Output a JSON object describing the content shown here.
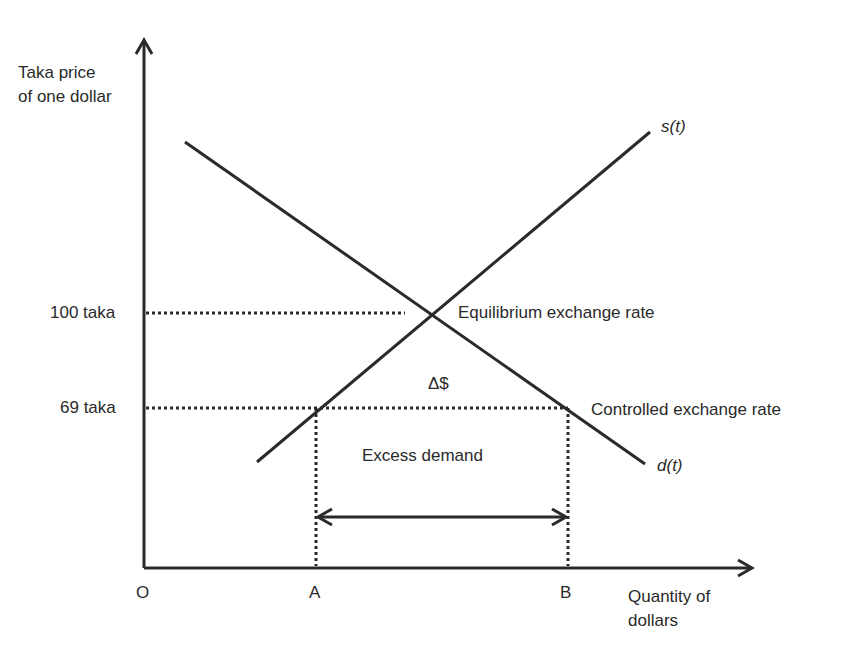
{
  "axes": {
    "y_label_line1": "Taka price",
    "y_label_line2": "of one dollar",
    "x_label_line1": "Quantity of",
    "x_label_line2": "dollars",
    "origin": "O"
  },
  "price_levels": [
    {
      "label": "100 taka",
      "name": "equilibrium"
    },
    {
      "label": "69 taka",
      "name": "controlled"
    }
  ],
  "quantity_points": {
    "a": "A",
    "b": "B"
  },
  "curves": {
    "supply": {
      "label_s": "s(",
      "label_t": "t",
      "label_close": ")"
    },
    "demand": {
      "label_d": "d(",
      "label_t": "t",
      "label_close": ")"
    }
  },
  "annotations": {
    "equilibrium": "Equilibrium exchange rate",
    "controlled": "Controlled exchange rate",
    "delta": "Δ$",
    "excess_demand": "Excess demand"
  },
  "colors": {
    "line": "#2a2a2a",
    "background": "#ffffff"
  }
}
